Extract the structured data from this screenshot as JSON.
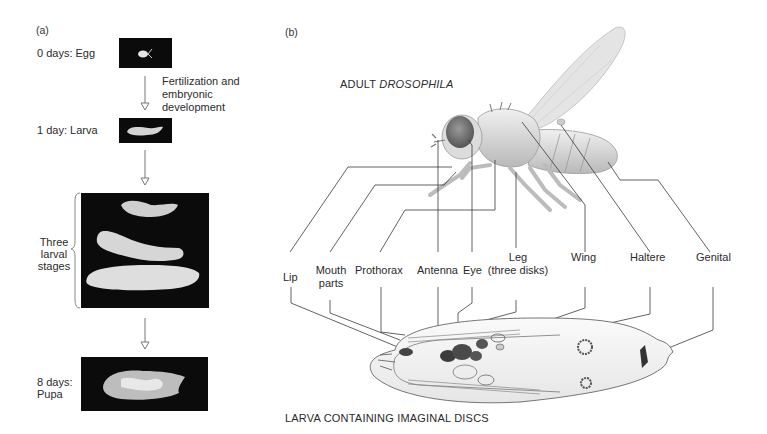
{
  "panel_a": {
    "tag": "(a)",
    "stages": [
      {
        "label": "0 days: Egg"
      },
      {
        "label": "1 day: Larva"
      },
      {
        "label_lines": [
          "Three",
          "larval",
          "stages"
        ]
      },
      {
        "label_lines": [
          "8 days:",
          "Pupa"
        ]
      }
    ],
    "transition_text": [
      "Fertilization and",
      "embryonic",
      "development"
    ]
  },
  "panel_b": {
    "tag": "(b)",
    "adult_title_prefix": "ADULT ",
    "adult_title_italic": "DROSOPHILA",
    "larva_title": "LARVA CONTAINING IMAGINAL DISCS",
    "disc_labels": [
      {
        "id": "lip",
        "lines": [
          "Lip"
        ]
      },
      {
        "id": "mouth-parts",
        "lines": [
          "Mouth",
          "parts"
        ]
      },
      {
        "id": "prothorax",
        "lines": [
          "Prothorax"
        ]
      },
      {
        "id": "antenna",
        "lines": [
          "Antenna"
        ]
      },
      {
        "id": "eye",
        "lines": [
          "Eye"
        ]
      },
      {
        "id": "leg",
        "lines": [
          "Leg",
          "(three disks)"
        ]
      },
      {
        "id": "wing",
        "lines": [
          "Wing"
        ]
      },
      {
        "id": "haltere",
        "lines": [
          "Haltere"
        ]
      },
      {
        "id": "genital",
        "lines": [
          "Genital"
        ]
      }
    ]
  },
  "colors": {
    "photo_bg": "#0b0b0b",
    "line": "#3a3a3a",
    "fly_body": "#d9d9d9",
    "eye": "#7a7a7a",
    "disc_dark": "#3c3c3c"
  }
}
